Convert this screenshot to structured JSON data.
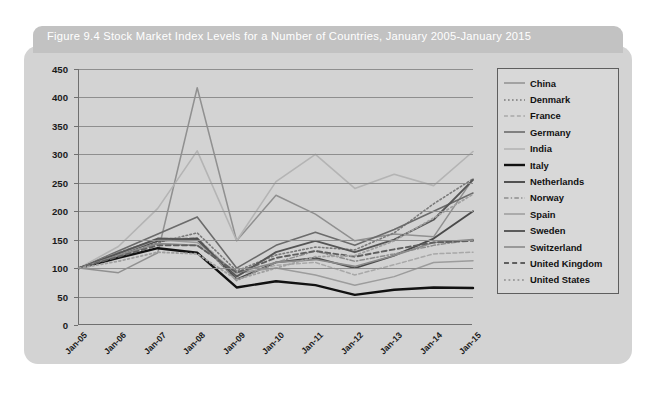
{
  "figure": {
    "title": "Figure 9.4  Stock Market Index Levels for a Number of Countries, January 2005-January 2015",
    "card_color": "#d3d3d3",
    "title_bar_color": "#c2c2c2",
    "title_text_color": "#ffffff"
  },
  "chart_data": {
    "type": "line",
    "title": "Figure 9.4  Stock Market Index Levels for a Number of Countries, January 2005-January 2015",
    "xlabel": "",
    "ylabel": "",
    "grid": true,
    "legend_position": "right",
    "ylim": [
      0,
      450
    ],
    "yticks": [
      0,
      50,
      100,
      150,
      200,
      250,
      300,
      350,
      400,
      450
    ],
    "categories": [
      "Jan-05",
      "Jan-06",
      "Jan-07",
      "Jan-08",
      "Jan-09",
      "Jan-10",
      "Jan-11",
      "Jan-12",
      "Jan-13",
      "Jan-14",
      "Jan-15"
    ],
    "series": [
      {
        "name": "China",
        "color": "#909090",
        "style": "solid",
        "width": 1.5,
        "values": [
          100,
          92,
          127,
          417,
          148,
          228,
          195,
          148,
          160,
          155,
          257
        ]
      },
      {
        "name": "Denmark",
        "color": "#7a7a7a",
        "style": "dotted",
        "width": 1.6,
        "values": [
          100,
          120,
          145,
          162,
          95,
          123,
          137,
          132,
          162,
          213,
          257
        ]
      },
      {
        "name": "France",
        "color": "#a8a8a8",
        "style": "dashed",
        "width": 1.5,
        "values": [
          100,
          126,
          152,
          153,
          88,
          105,
          110,
          88,
          106,
          125,
          128
        ]
      },
      {
        "name": "Germany",
        "color": "#6b6b6b",
        "style": "solid",
        "width": 1.6,
        "values": [
          100,
          130,
          160,
          190,
          100,
          140,
          163,
          140,
          168,
          200,
          232
        ]
      },
      {
        "name": "India",
        "color": "#b4b4b4",
        "style": "solid",
        "width": 1.6,
        "values": [
          100,
          138,
          205,
          306,
          148,
          252,
          300,
          240,
          265,
          245,
          305
        ]
      },
      {
        "name": "Italy",
        "color": "#111111",
        "style": "solid",
        "width": 2.4,
        "values": [
          100,
          118,
          135,
          127,
          66,
          77,
          70,
          53,
          62,
          66,
          65
        ]
      },
      {
        "name": "Netherlands",
        "color": "#4a4a4a",
        "style": "solid",
        "width": 1.9,
        "values": [
          100,
          124,
          148,
          152,
          80,
          110,
          118,
          100,
          122,
          152,
          200
        ]
      },
      {
        "name": "Norway",
        "color": "#8d8d8d",
        "style": "dashdot",
        "width": 1.5,
        "values": [
          100,
          128,
          150,
          150,
          78,
          110,
          130,
          112,
          125,
          140,
          150
        ]
      },
      {
        "name": "Spain",
        "color": "#9c9c9c",
        "style": "solid",
        "width": 1.5,
        "values": [
          100,
          124,
          150,
          145,
          92,
          100,
          88,
          70,
          85,
          110,
          113
        ]
      },
      {
        "name": "Sweden",
        "color": "#555555",
        "style": "solid",
        "width": 1.9,
        "values": [
          100,
          126,
          152,
          150,
          85,
          128,
          148,
          128,
          150,
          185,
          255
        ]
      },
      {
        "name": "Switzerland",
        "color": "#8a8a8a",
        "style": "solid",
        "width": 1.6,
        "values": [
          100,
          122,
          143,
          140,
          92,
          110,
          115,
          103,
          122,
          145,
          150
        ]
      },
      {
        "name": "United Kingdom",
        "color": "#5f5f5f",
        "style": "dashed",
        "width": 1.9,
        "values": [
          100,
          120,
          140,
          140,
          92,
          118,
          130,
          120,
          133,
          145,
          148
        ]
      },
      {
        "name": "United States",
        "color": "#a0a0a0",
        "style": "dotted",
        "width": 1.8,
        "values": [
          100,
          112,
          128,
          125,
          80,
          100,
          120,
          122,
          148,
          188,
          230
        ]
      }
    ]
  }
}
